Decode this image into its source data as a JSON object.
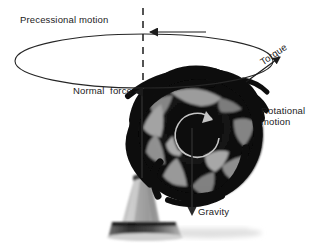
{
  "figure": {
    "background_color": "#ffffff",
    "ink_color": "#1b1b1b",
    "width": 321,
    "height": 250
  },
  "labels": {
    "precession": "Precessional motion",
    "normal_force": "Normal  force",
    "torque": "Torque",
    "rotational_line1": "Rotational",
    "rotational_line2": "motion",
    "gravity": "Gravity"
  },
  "vectors": [
    {
      "name": "precession-arrow",
      "label": "Precessional motion",
      "direction": "left",
      "from": [
        205,
        32
      ],
      "to": [
        148,
        32
      ]
    },
    {
      "name": "normal-force-arrow",
      "label": "Normal  force",
      "direction": "up",
      "from": [
        142,
        178
      ],
      "to": [
        142,
        89
      ]
    },
    {
      "name": "torque-arrow",
      "label": "Torque",
      "direction": "up-right",
      "from": [
        246,
        82
      ],
      "to": [
        281,
        56
      ]
    },
    {
      "name": "gravity-arrow",
      "label": "Gravity",
      "direction": "down",
      "from": [
        192,
        128
      ],
      "to": [
        192,
        216
      ]
    },
    {
      "name": "spin-arrow",
      "label": "Rotational motion",
      "direction": "circular",
      "center": [
        193,
        133
      ],
      "radius": 22
    }
  ],
  "geometry": {
    "precession_ellipse": {
      "center_x": 144,
      "center_y": 61,
      "radius_x": 129,
      "radius_y": 27
    },
    "spin_axis_dashed_line": {
      "x": 143,
      "y_top": 8,
      "y_bottom": 82
    },
    "gyroscope_wheel": {
      "center_x": 196,
      "center_y": 134,
      "radius": 66
    },
    "pedestal": {
      "top_x": 140,
      "top_y": 176,
      "base_y": 224
    }
  },
  "colors": {
    "ink": "#1b1b1b",
    "wheel_dark": "#0d0d0d",
    "wheel_mid": "#8c8c8c",
    "wheel_light": "#c9c9c9",
    "pedestal": "#b5b5b5",
    "shadow": "#d8d8d8"
  }
}
